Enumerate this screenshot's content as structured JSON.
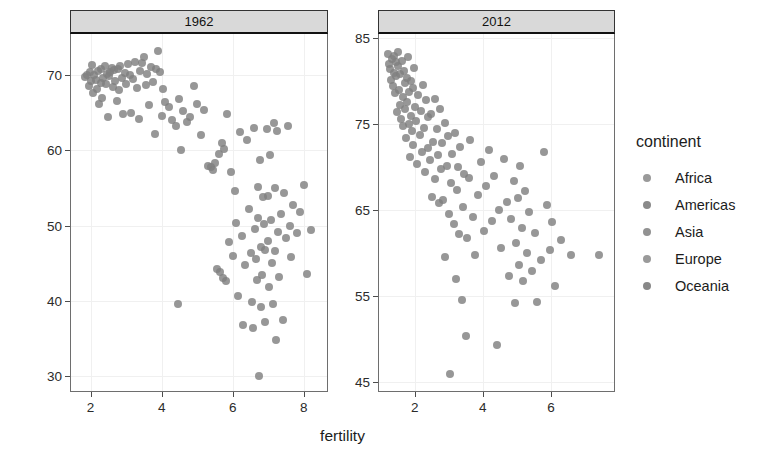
{
  "chart_data": {
    "type": "scatter",
    "title": "",
    "xlabel": "fertility",
    "ylabel": "life_expectancy",
    "grid": true,
    "legend_position": "right",
    "facet_variable": "year",
    "color_variable": "continent",
    "legend": {
      "title": "continent",
      "entries": [
        {
          "label": "Africa",
          "color": "#9a9a9a"
        },
        {
          "label": "Americas",
          "color": "#8a8a8a"
        },
        {
          "label": "Asia",
          "color": "#929292"
        },
        {
          "label": "Europe",
          "color": "#9a9a9a"
        },
        {
          "label": "Oceania",
          "color": "#888888"
        }
      ]
    },
    "point_color": "#808080",
    "panels": [
      {
        "label": "1962",
        "xlim": [
          1.45,
          8.65
        ],
        "ylim": [
          28.0,
          75.5
        ],
        "xticks": [
          2,
          4,
          6,
          8
        ],
        "yticks": [
          30,
          40,
          50,
          60,
          70
        ],
        "points": [
          [
            1.85,
            69.8
          ],
          [
            1.9,
            70.1
          ],
          [
            1.95,
            68.6
          ],
          [
            1.98,
            70.4
          ],
          [
            2.02,
            69.2
          ],
          [
            2.05,
            71.4
          ],
          [
            2.08,
            67.6
          ],
          [
            2.1,
            70.0
          ],
          [
            2.14,
            69.4
          ],
          [
            2.18,
            68.2
          ],
          [
            2.22,
            70.6
          ],
          [
            2.25,
            66.2
          ],
          [
            2.28,
            69.0
          ],
          [
            2.3,
            70.8
          ],
          [
            2.33,
            67.0
          ],
          [
            2.36,
            69.6
          ],
          [
            2.4,
            71.2
          ],
          [
            2.44,
            68.8
          ],
          [
            2.47,
            70.2
          ],
          [
            2.5,
            64.4
          ],
          [
            2.53,
            69.9
          ],
          [
            2.56,
            70.5
          ],
          [
            2.6,
            71.0
          ],
          [
            2.63,
            68.4
          ],
          [
            2.66,
            70.7
          ],
          [
            2.7,
            69.3
          ],
          [
            2.73,
            66.6
          ],
          [
            2.76,
            70.9
          ],
          [
            2.8,
            68.0
          ],
          [
            2.84,
            71.3
          ],
          [
            2.88,
            69.7
          ],
          [
            2.92,
            64.8
          ],
          [
            2.96,
            70.3
          ],
          [
            3.0,
            68.9
          ],
          [
            3.05,
            71.5
          ],
          [
            3.1,
            70.1
          ],
          [
            3.15,
            65.0
          ],
          [
            3.2,
            69.5
          ],
          [
            3.25,
            71.8
          ],
          [
            3.3,
            68.3
          ],
          [
            3.35,
            64.2
          ],
          [
            3.4,
            70.6
          ],
          [
            3.45,
            71.6
          ],
          [
            3.5,
            72.4
          ],
          [
            3.55,
            68.7
          ],
          [
            3.6,
            70.2
          ],
          [
            3.65,
            66.0
          ],
          [
            3.7,
            71.1
          ],
          [
            3.75,
            69.1
          ],
          [
            3.8,
            62.2
          ],
          [
            3.85,
            70.8
          ],
          [
            3.9,
            73.2
          ],
          [
            3.95,
            70.4
          ],
          [
            4.0,
            64.6
          ],
          [
            4.05,
            68.2
          ],
          [
            4.1,
            66.4
          ],
          [
            4.2,
            65.8
          ],
          [
            4.3,
            64.0
          ],
          [
            4.4,
            63.2
          ],
          [
            4.45,
            39.6
          ],
          [
            4.5,
            66.8
          ],
          [
            4.55,
            60.0
          ],
          [
            4.6,
            65.2
          ],
          [
            4.7,
            63.8
          ],
          [
            4.8,
            64.4
          ],
          [
            4.9,
            68.6
          ],
          [
            5.0,
            66.2
          ],
          [
            5.1,
            62.0
          ],
          [
            5.2,
            65.4
          ],
          [
            5.3,
            58.0
          ],
          [
            5.4,
            57.8
          ],
          [
            5.45,
            57.4
          ],
          [
            5.5,
            58.4
          ],
          [
            5.55,
            44.2
          ],
          [
            5.6,
            59.6
          ],
          [
            5.65,
            43.8
          ],
          [
            5.7,
            61.0
          ],
          [
            5.72,
            43.0
          ],
          [
            5.75,
            60.2
          ],
          [
            5.8,
            42.6
          ],
          [
            5.85,
            64.8
          ],
          [
            5.9,
            47.8
          ],
          [
            5.95,
            57.2
          ],
          [
            6.0,
            46.0
          ],
          [
            6.05,
            54.6
          ],
          [
            6.1,
            50.4
          ],
          [
            6.15,
            40.6
          ],
          [
            6.2,
            62.4
          ],
          [
            6.25,
            48.6
          ],
          [
            6.3,
            36.8
          ],
          [
            6.35,
            44.8
          ],
          [
            6.4,
            61.4
          ],
          [
            6.45,
            52.2
          ],
          [
            6.5,
            46.4
          ],
          [
            6.55,
            39.8
          ],
          [
            6.58,
            36.4
          ],
          [
            6.6,
            63.0
          ],
          [
            6.62,
            49.6
          ],
          [
            6.65,
            45.6
          ],
          [
            6.68,
            42.8
          ],
          [
            6.7,
            55.2
          ],
          [
            6.72,
            51.0
          ],
          [
            6.74,
            30.0
          ],
          [
            6.76,
            58.8
          ],
          [
            6.78,
            47.2
          ],
          [
            6.8,
            39.2
          ],
          [
            6.82,
            43.4
          ],
          [
            6.85,
            53.8
          ],
          [
            6.88,
            50.2
          ],
          [
            6.9,
            37.2
          ],
          [
            6.92,
            46.8
          ],
          [
            6.95,
            62.8
          ],
          [
            6.98,
            54.0
          ],
          [
            7.0,
            48.0
          ],
          [
            7.02,
            41.8
          ],
          [
            7.05,
            59.4
          ],
          [
            7.08,
            50.8
          ],
          [
            7.1,
            45.0
          ],
          [
            7.12,
            39.6
          ],
          [
            7.15,
            63.6
          ],
          [
            7.18,
            55.0
          ],
          [
            7.2,
            46.6
          ],
          [
            7.22,
            34.8
          ],
          [
            7.25,
            62.6
          ],
          [
            7.28,
            49.2
          ],
          [
            7.3,
            43.2
          ],
          [
            7.35,
            51.6
          ],
          [
            7.4,
            37.4
          ],
          [
            7.45,
            54.4
          ],
          [
            7.5,
            48.4
          ],
          [
            7.55,
            63.2
          ],
          [
            7.6,
            50.0
          ],
          [
            7.65,
            45.8
          ],
          [
            7.7,
            52.8
          ],
          [
            7.8,
            49.0
          ],
          [
            7.9,
            51.8
          ],
          [
            8.0,
            55.4
          ],
          [
            8.1,
            43.6
          ],
          [
            8.2,
            49.4
          ]
        ]
      },
      {
        "label": "2012",
        "xlim": [
          0.95,
          7.85
        ],
        "ylim": [
          44.0,
          85.5
        ],
        "xticks": [
          2,
          4,
          6
        ],
        "yticks": [
          45,
          55,
          65,
          75,
          85
        ],
        "points": [
          [
            1.2,
            83.2
          ],
          [
            1.24,
            82.0
          ],
          [
            1.28,
            81.4
          ],
          [
            1.3,
            80.2
          ],
          [
            1.33,
            82.6
          ],
          [
            1.36,
            79.4
          ],
          [
            1.38,
            83.0
          ],
          [
            1.4,
            81.0
          ],
          [
            1.42,
            78.6
          ],
          [
            1.44,
            82.2
          ],
          [
            1.46,
            80.6
          ],
          [
            1.48,
            76.4
          ],
          [
            1.5,
            81.8
          ],
          [
            1.52,
            83.4
          ],
          [
            1.54,
            79.0
          ],
          [
            1.56,
            77.2
          ],
          [
            1.58,
            80.8
          ],
          [
            1.6,
            75.6
          ],
          [
            1.62,
            82.4
          ],
          [
            1.64,
            78.2
          ],
          [
            1.66,
            74.8
          ],
          [
            1.68,
            81.2
          ],
          [
            1.7,
            76.8
          ],
          [
            1.72,
            79.8
          ],
          [
            1.74,
            73.4
          ],
          [
            1.76,
            80.4
          ],
          [
            1.78,
            77.6
          ],
          [
            1.8,
            82.8
          ],
          [
            1.82,
            75.0
          ],
          [
            1.84,
            78.8
          ],
          [
            1.86,
            71.2
          ],
          [
            1.88,
            80.0
          ],
          [
            1.9,
            76.0
          ],
          [
            1.92,
            74.2
          ],
          [
            1.94,
            79.2
          ],
          [
            1.96,
            72.6
          ],
          [
            1.98,
            81.6
          ],
          [
            2.0,
            77.0
          ],
          [
            2.04,
            75.4
          ],
          [
            2.08,
            70.4
          ],
          [
            2.1,
            78.4
          ],
          [
            2.14,
            73.8
          ],
          [
            2.18,
            76.6
          ],
          [
            2.2,
            71.8
          ],
          [
            2.24,
            79.6
          ],
          [
            2.28,
            74.6
          ],
          [
            2.3,
            69.4
          ],
          [
            2.34,
            77.8
          ],
          [
            2.38,
            72.2
          ],
          [
            2.4,
            75.8
          ],
          [
            2.44,
            70.8
          ],
          [
            2.48,
            76.2
          ],
          [
            2.5,
            66.6
          ],
          [
            2.54,
            73.0
          ],
          [
            2.58,
            78.0
          ],
          [
            2.6,
            68.6
          ],
          [
            2.64,
            74.4
          ],
          [
            2.68,
            71.4
          ],
          [
            2.7,
            65.8
          ],
          [
            2.74,
            76.8
          ],
          [
            2.78,
            69.8
          ],
          [
            2.8,
            72.8
          ],
          [
            2.84,
            66.2
          ],
          [
            2.88,
            75.2
          ],
          [
            2.9,
            59.6
          ],
          [
            2.94,
            70.2
          ],
          [
            2.98,
            73.6
          ],
          [
            3.0,
            64.6
          ],
          [
            3.02,
            46.0
          ],
          [
            3.06,
            68.2
          ],
          [
            3.1,
            71.6
          ],
          [
            3.14,
            63.4
          ],
          [
            3.18,
            74.0
          ],
          [
            3.2,
            57.0
          ],
          [
            3.24,
            67.4
          ],
          [
            3.28,
            70.0
          ],
          [
            3.3,
            62.2
          ],
          [
            3.34,
            72.4
          ],
          [
            3.38,
            54.6
          ],
          [
            3.42,
            65.4
          ],
          [
            3.46,
            69.2
          ],
          [
            3.5,
            50.4
          ],
          [
            3.54,
            61.8
          ],
          [
            3.58,
            68.8
          ],
          [
            3.62,
            73.2
          ],
          [
            3.7,
            64.2
          ],
          [
            3.78,
            59.8
          ],
          [
            3.86,
            66.8
          ],
          [
            3.94,
            70.6
          ],
          [
            4.02,
            62.6
          ],
          [
            4.1,
            67.8
          ],
          [
            4.18,
            72.0
          ],
          [
            4.26,
            63.8
          ],
          [
            4.34,
            69.0
          ],
          [
            4.4,
            49.4
          ],
          [
            4.46,
            65.0
          ],
          [
            4.54,
            60.6
          ],
          [
            4.62,
            71.0
          ],
          [
            4.7,
            66.0
          ],
          [
            4.78,
            57.4
          ],
          [
            4.84,
            64.0
          ],
          [
            4.9,
            68.4
          ],
          [
            4.94,
            54.2
          ],
          [
            4.98,
            61.2
          ],
          [
            5.02,
            66.4
          ],
          [
            5.06,
            58.6
          ],
          [
            5.1,
            70.2
          ],
          [
            5.14,
            63.0
          ],
          [
            5.18,
            56.8
          ],
          [
            5.24,
            67.2
          ],
          [
            5.3,
            60.0
          ],
          [
            5.36,
            64.8
          ],
          [
            5.44,
            58.0
          ],
          [
            5.52,
            62.4
          ],
          [
            5.6,
            54.4
          ],
          [
            5.7,
            59.2
          ],
          [
            5.8,
            71.8
          ],
          [
            5.88,
            65.6
          ],
          [
            5.96,
            60.4
          ],
          [
            6.04,
            63.6
          ],
          [
            6.12,
            56.2
          ],
          [
            6.3,
            61.6
          ],
          [
            6.6,
            59.8
          ],
          [
            7.4,
            59.8
          ]
        ]
      }
    ]
  }
}
